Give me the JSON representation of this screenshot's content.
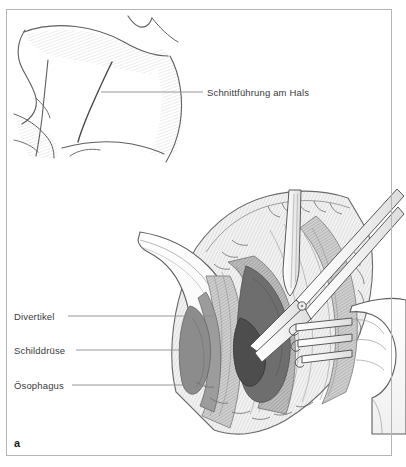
{
  "figure": {
    "letter": "a",
    "border_color": "#b5b5b5",
    "background_color": "#ffffff",
    "text_color": "#3a3a3a",
    "ink_color": "#4a4a4a",
    "leader_color": "#8c8c8c"
  },
  "upper_illustration": {
    "name": "neck-profile-with-incision-line",
    "description": "Lateral view of a patient's neck and shoulder showing the planned surgical incision",
    "labels": [
      {
        "id": "incision",
        "text": "Schnittführung am Hals"
      }
    ]
  },
  "lower_illustration": {
    "name": "open-neck-wound-with-instruments",
    "description": "Intraoperative view of the opened neck wound held by retractors, showing diverticulum, thyroid gland and esophagus",
    "labels": [
      {
        "id": "diverticulum",
        "text": "Divertikel"
      },
      {
        "id": "thyroid",
        "text": "Schilddrüse"
      },
      {
        "id": "esophagus",
        "text": "Ösophagus"
      }
    ],
    "instruments": [
      {
        "id": "retractor-blade",
        "name": "narrow-retractor-blade"
      },
      {
        "id": "forceps",
        "name": "surgical-scissors-forceps"
      },
      {
        "id": "rake-retractor",
        "name": "three-prong-rake-retractor"
      },
      {
        "id": "surgeon-hand",
        "name": "surgeon-hand"
      }
    ],
    "tissue_tones": {
      "skin_flap": "#fbfbfb",
      "muscle_light": "#d8d8d8",
      "muscle_mid": "#b9b9b9",
      "muscle_dark": "#9a9a9a",
      "cavity_dark": "#6e6e6e",
      "cavity_darkest": "#4d4d4d"
    }
  }
}
